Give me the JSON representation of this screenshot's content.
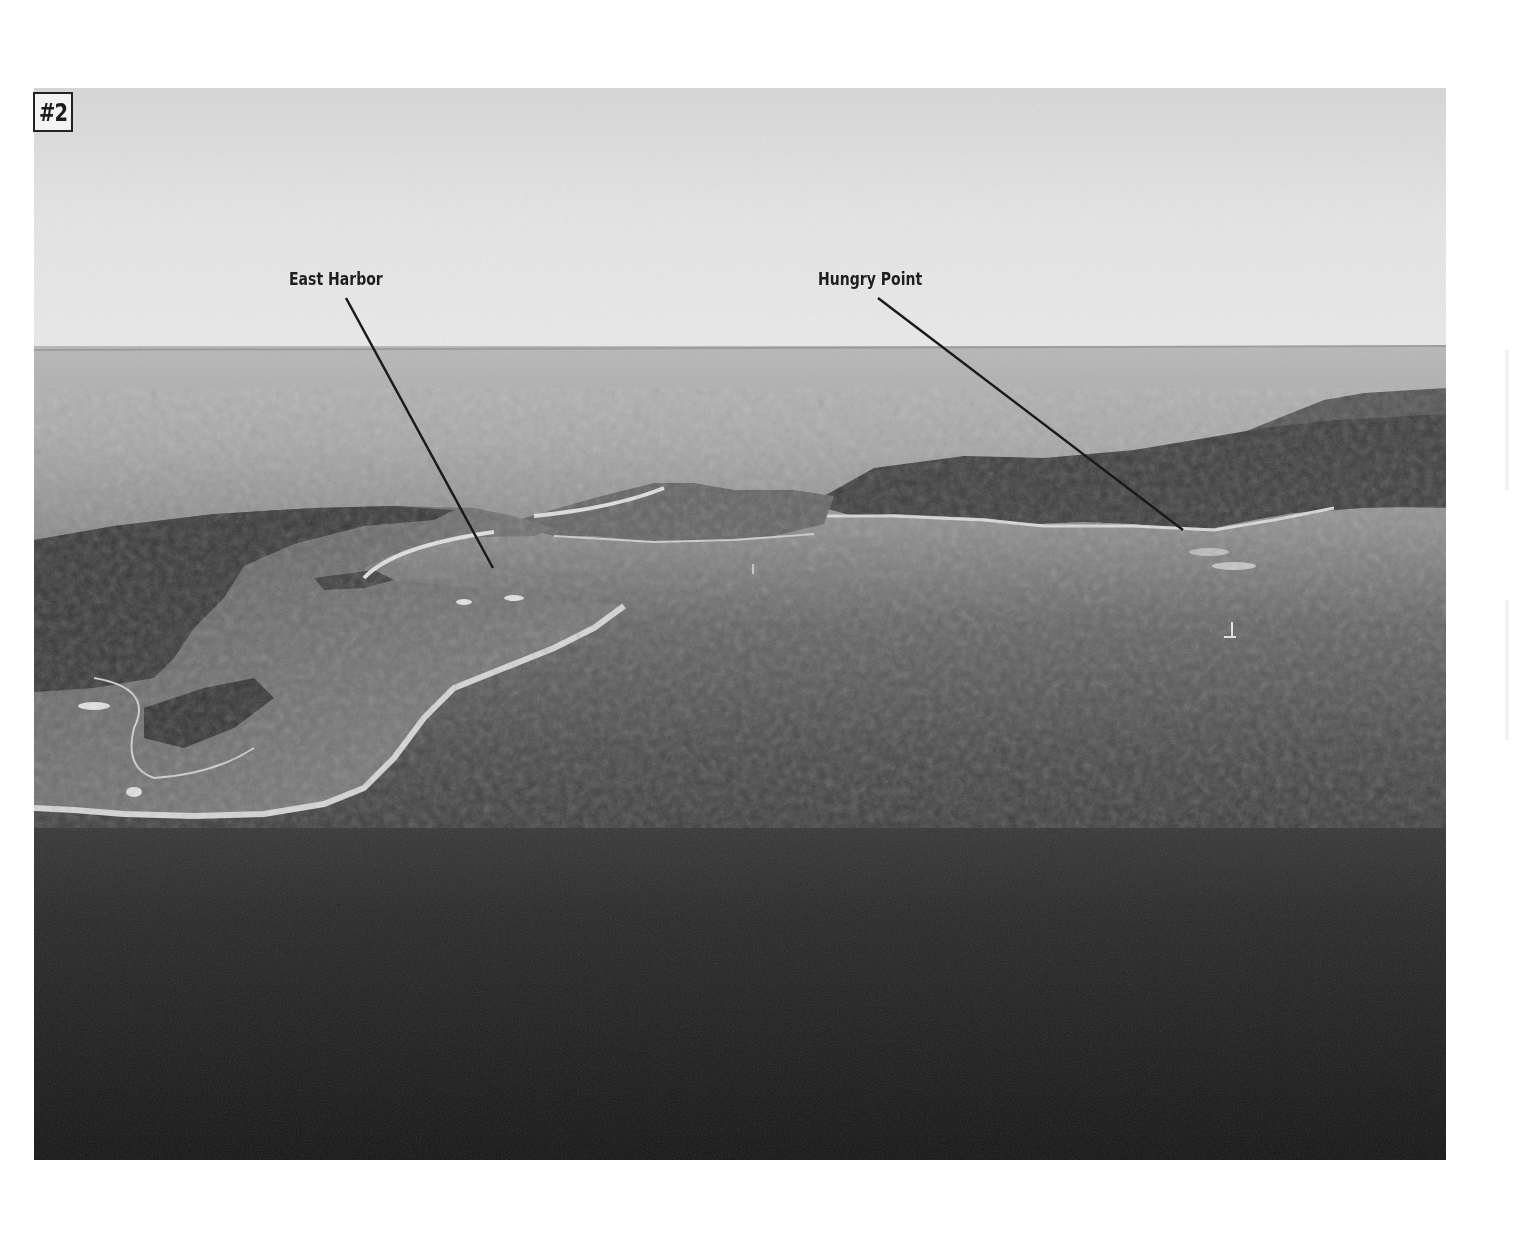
{
  "figure": {
    "badge": "#2",
    "photo_type": "aerial photograph, black and white",
    "colors": {
      "sky": "#e4e4e4",
      "horizon_sea": "#b4b4b4",
      "near_water": "#5a5a5a",
      "deep_water": "#141414",
      "land": "#6e6e6e",
      "trees": "#2f2f2f",
      "beach": "#e0e0e0",
      "leader_line": "#1a1a1a"
    },
    "annotations": [
      {
        "label": "East Harbor",
        "label_x": 289,
        "label_y": 270,
        "line_from": [
          346,
          298
        ],
        "line_to": [
          493,
          568
        ]
      },
      {
        "label": "Hungry Point",
        "label_x": 818,
        "label_y": 270,
        "line_from": [
          878,
          298
        ],
        "line_to": [
          1183,
          530
        ]
      }
    ]
  }
}
